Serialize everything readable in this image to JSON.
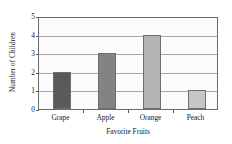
{
  "chart_data": {
    "type": "bar",
    "title": "",
    "categories": [
      "Grape",
      "Apple",
      "Orange",
      "Peach"
    ],
    "values": [
      2,
      3,
      4,
      1
    ],
    "series": [
      {
        "name": "Number of Children",
        "values": [
          2,
          3,
          4,
          1
        ]
      }
    ],
    "xlabel": "Favorite Fruits",
    "ylabel": "Number of Children",
    "ylim": [
      0,
      5
    ],
    "yticks": [
      0,
      1,
      2,
      3,
      4,
      5
    ],
    "ytick_labels": [
      "0",
      "1",
      "2",
      "3",
      "4",
      "5"
    ],
    "grid": true,
    "grid_axis": "y",
    "legend": false,
    "bar_colors": [
      "#5a5a5a",
      "#838383",
      "#b4b4b4",
      "#c6c6c6"
    ],
    "plot_background": "#fbfbfb",
    "axis_color": "#6b6b6b",
    "gridline_color": "#a8a8a8"
  }
}
